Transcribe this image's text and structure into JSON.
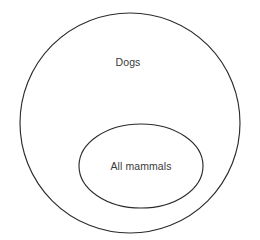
{
  "diagram": {
    "type": "nested-set-diagram",
    "background_color": "#ffffff",
    "stroke_color": "#2b2b2b",
    "text_color": "#3a3a3a",
    "sets": [
      {
        "id": "outer",
        "label": "Dogs",
        "shape": "circle",
        "center_x": 130,
        "center_y": 123,
        "radius_x": 110,
        "radius_y": 110,
        "label_x": 128,
        "label_y": 62
      },
      {
        "id": "inner",
        "label": "All mammals",
        "shape": "ellipse",
        "center_x": 141,
        "center_y": 166,
        "radius_x": 62,
        "radius_y": 42,
        "label_x": 141,
        "label_y": 166
      }
    ]
  }
}
